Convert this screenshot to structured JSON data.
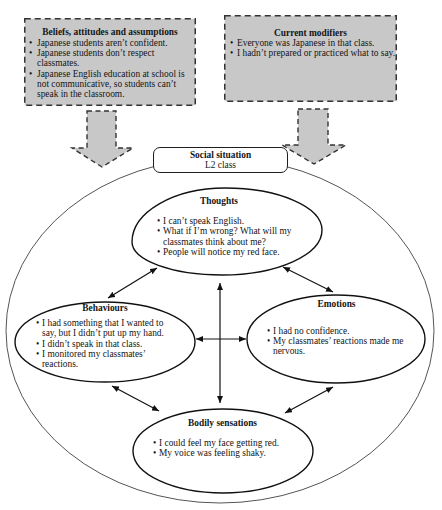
{
  "diagram": {
    "influences": {
      "beliefs": {
        "title": "Beliefs, attitudes and assumptions",
        "items": [
          "Japanese students aren’t confident.",
          "Japanese students don’t respect classmates.",
          "Japanese English education at school is not communicative, so students can’t speak in the classroom."
        ]
      },
      "modifiers": {
        "title": "Current modifiers",
        "items": [
          "Everyone was Japanese in that class.",
          "I hadn’t prepared or practiced what to say."
        ]
      }
    },
    "social_situation": {
      "title": "Social situation",
      "subtitle": "L2 class"
    },
    "components": {
      "thoughts": {
        "title": "Thoughts",
        "items": [
          "I can’t speak English.",
          "What if I’m wrong? What will my classmates think about me?",
          "People will notice my red face."
        ]
      },
      "behaviours": {
        "title": "Behaviours",
        "items": [
          "I had something that I wanted to say, but I didn’t put up my hand.",
          "I didn’t speak in that class.",
          "I monitored my classmates’ reactions."
        ]
      },
      "emotions": {
        "title": "Emotions",
        "items": [
          "I had no confidence.",
          "My classmates’ reactions made me nervous."
        ]
      },
      "bodily_sensations": {
        "title": "Bodily sensations",
        "items": [
          "I could feel my face getting red.",
          "My voice was feeling shaky."
        ]
      }
    },
    "influence_arrows": [
      {
        "from": "beliefs",
        "to": "social_situation"
      },
      {
        "from": "modifiers",
        "to": "social_situation"
      }
    ],
    "connections": [
      {
        "from": "thoughts",
        "to": "behaviours",
        "direction": "both"
      },
      {
        "from": "thoughts",
        "to": "emotions",
        "direction": "both"
      },
      {
        "from": "thoughts",
        "to": "bodily_sensations",
        "direction": "both"
      },
      {
        "from": "behaviours",
        "to": "emotions",
        "direction": "both"
      },
      {
        "from": "behaviours",
        "to": "bodily_sensations",
        "direction": "both"
      },
      {
        "from": "emotions",
        "to": "bodily_sensations",
        "direction": "both"
      }
    ]
  },
  "colors": {
    "influence_box_fill": "#c8c8c8",
    "dashed_stroke": "#333333",
    "line_stroke": "#111111",
    "outer_circle_stroke": "#555555",
    "background": "#ffffff"
  }
}
